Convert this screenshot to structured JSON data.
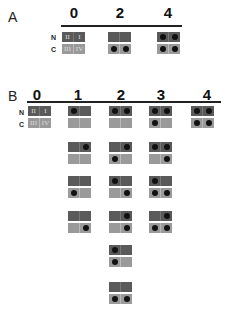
{
  "panels": [
    {
      "label": "A",
      "columns": [
        "0",
        "2",
        "4"
      ],
      "row_labels": [
        "N",
        "C"
      ],
      "units": [
        {
          "col": "0",
          "N": {
            "labels": [
              "II",
              "I"
            ],
            "dots": [
              false,
              false
            ]
          },
          "C": {
            "labels": [
              "III",
              "IV"
            ],
            "dots": [
              false,
              false
            ]
          }
        },
        {
          "col": "2",
          "N": {
            "labels": [
              "",
              ""
            ],
            "dots": [
              false,
              false
            ]
          },
          "C": {
            "labels": [
              "",
              ""
            ],
            "dots": [
              true,
              true
            ]
          }
        },
        {
          "col": "4",
          "N": {
            "labels": [
              "",
              ""
            ],
            "dots": [
              true,
              true
            ]
          },
          "C": {
            "labels": [
              "",
              ""
            ],
            "dots": [
              true,
              true
            ]
          }
        }
      ]
    },
    {
      "label": "B",
      "columns": [
        "0",
        "1",
        "2",
        "3",
        "4"
      ],
      "row_labels": [
        "N",
        "C"
      ],
      "units": {
        "0": [
          {
            "N": {
              "labels": [
                "II",
                "I"
              ],
              "dots": [
                false,
                false
              ]
            },
            "C": {
              "labels": [
                "III",
                "IV"
              ],
              "dots": [
                false,
                false
              ]
            }
          }
        ],
        "1": [
          {
            "N": {
              "dots": [
                true,
                false
              ]
            },
            "C": {
              "dots": [
                false,
                false
              ]
            }
          },
          {
            "N": {
              "dots": [
                false,
                true
              ]
            },
            "C": {
              "dots": [
                false,
                false
              ]
            }
          },
          {
            "N": {
              "dots": [
                false,
                false
              ]
            },
            "C": {
              "dots": [
                true,
                false
              ]
            }
          },
          {
            "N": {
              "dots": [
                false,
                false
              ]
            },
            "C": {
              "dots": [
                false,
                true
              ]
            }
          }
        ],
        "2": [
          {
            "N": {
              "dots": [
                true,
                true
              ]
            },
            "C": {
              "dots": [
                false,
                false
              ]
            }
          },
          {
            "N": {
              "dots": [
                false,
                true
              ]
            },
            "C": {
              "dots": [
                true,
                false
              ]
            }
          },
          {
            "N": {
              "dots": [
                true,
                false
              ]
            },
            "C": {
              "dots": [
                false,
                true
              ]
            }
          },
          {
            "N": {
              "dots": [
                false,
                true
              ]
            },
            "C": {
              "dots": [
                false,
                true
              ]
            }
          },
          {
            "N": {
              "dots": [
                true,
                false
              ]
            },
            "C": {
              "dots": [
                true,
                false
              ]
            }
          },
          {
            "N": {
              "dots": [
                false,
                false
              ]
            },
            "C": {
              "dots": [
                true,
                true
              ]
            }
          }
        ],
        "3": [
          {
            "N": {
              "dots": [
                true,
                true
              ]
            },
            "C": {
              "dots": [
                true,
                false
              ]
            }
          },
          {
            "N": {
              "dots": [
                true,
                true
              ]
            },
            "C": {
              "dots": [
                false,
                true
              ]
            }
          },
          {
            "N": {
              "dots": [
                true,
                false
              ]
            },
            "C": {
              "dots": [
                true,
                true
              ]
            }
          },
          {
            "N": {
              "dots": [
                false,
                true
              ]
            },
            "C": {
              "dots": [
                true,
                true
              ]
            }
          }
        ],
        "4": [
          {
            "N": {
              "dots": [
                true,
                true
              ]
            },
            "C": {
              "dots": [
                true,
                true
              ]
            }
          }
        ]
      }
    }
  ],
  "colors": {
    "n_box": "#5a5a5a",
    "c_box": "#9a9a9a",
    "dot": "#111111"
  }
}
